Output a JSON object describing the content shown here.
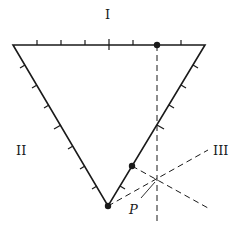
{
  "diagram": {
    "type": "ternary-triangle",
    "labels": {
      "top": "I",
      "left": "II",
      "right": "III",
      "point": "P"
    },
    "ticks_per_side": 8,
    "colors": {
      "ink": "#1a1a1a",
      "background": "#ffffff"
    }
  }
}
